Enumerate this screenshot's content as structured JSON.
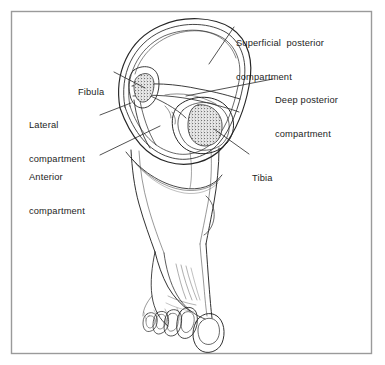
{
  "figure": {
    "kind": "anatomical-illustration",
    "background_color": "#ffffff",
    "border_color": "#9a9a9a",
    "ink_color": "#1d1d1d",
    "line_color": "#333333",
    "bone_fill_color": "#8a8a8a",
    "frame": {
      "x": 11,
      "y": 11,
      "width": 361,
      "height": 343
    },
    "labels": [
      {
        "id": "superficial-posterior-compartment",
        "lines": [
          "Superficial  posterior",
          "compartment"
        ],
        "line1": "Superficial  posterior",
        "line2": "compartment",
        "x": 236,
        "y": 15,
        "leader": {
          "x1": 234,
          "y1": 27,
          "x2": 209,
          "y2": 64
        }
      },
      {
        "id": "deep-posterior-compartment",
        "lines": [
          "Deep posterior",
          "compartment"
        ],
        "line1": "Deep posterior",
        "line2": "compartment",
        "x": 275,
        "y": 72,
        "leader": {
          "x1": 273,
          "y1": 79,
          "x2": 186,
          "y2": 96
        }
      },
      {
        "id": "fibula",
        "lines": [
          "Fibula"
        ],
        "line1": "Fibula",
        "line2": "",
        "x": 78,
        "y": 64,
        "leader": {
          "x1": 114,
          "y1": 72,
          "x2": 143,
          "y2": 88
        }
      },
      {
        "id": "lateral-compartment",
        "lines": [
          "Lateral",
          "compartment"
        ],
        "line1": "Lateral",
        "line2": "compartment",
        "x": 29,
        "y": 97,
        "leader": {
          "x1": 100,
          "y1": 115,
          "x2": 131,
          "y2": 103
        }
      },
      {
        "id": "anterior-compartment",
        "lines": [
          "Anterior",
          "compartment"
        ],
        "line1": "Anterior",
        "line2": "compartment",
        "x": 29,
        "y": 149,
        "leader": {
          "x1": 100,
          "y1": 155,
          "x2": 160,
          "y2": 126
        }
      },
      {
        "id": "tibia",
        "lines": [
          "Tibia"
        ],
        "line1": "Tibia",
        "line2": "",
        "x": 252,
        "y": 150,
        "leader": {
          "x1": 249,
          "y1": 154,
          "x2": 214,
          "y2": 129
        }
      }
    ],
    "structures": [
      {
        "id": "leg-cross-section-outline",
        "name": "Leg cross section outer outline"
      },
      {
        "id": "fascia-ring",
        "name": "Crural fascia ring"
      },
      {
        "id": "interosseous-membrane",
        "name": "Interosseous membrane / septa"
      },
      {
        "id": "tibia-bone",
        "name": "Tibia bone (stippled)"
      },
      {
        "id": "fibula-bone",
        "name": "Fibula bone (stippled)"
      },
      {
        "id": "lower-leg-shaft",
        "name": "Lower leg shaft"
      },
      {
        "id": "ankle",
        "name": "Ankle"
      },
      {
        "id": "foot-dorsum",
        "name": "Dorsum of the foot"
      },
      {
        "id": "toes",
        "name": "Toes with nails"
      }
    ]
  }
}
